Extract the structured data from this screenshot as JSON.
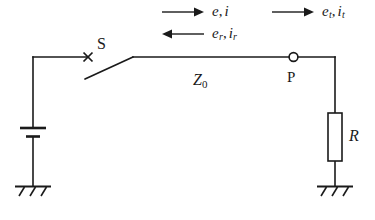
{
  "figure": {
    "name": "transmission-line-circuit",
    "background_color": "#ffffff",
    "line_color": "#1a1a1a"
  },
  "wave_annotations": [
    {
      "id": "incident",
      "arrow_direction": "right",
      "symbol_voltage": "e",
      "symbol_voltage_sub": "",
      "separator": ",",
      "symbol_current": "i",
      "symbol_current_sub": ""
    },
    {
      "id": "transmitted",
      "arrow_direction": "right",
      "symbol_voltage": "e",
      "symbol_voltage_sub": "t",
      "separator": ",",
      "symbol_current": "i",
      "symbol_current_sub": "t"
    },
    {
      "id": "reflected",
      "arrow_direction": "left",
      "symbol_voltage": "e",
      "symbol_voltage_sub": "r",
      "separator": ",",
      "symbol_current": "i",
      "symbol_current_sub": "r"
    }
  ],
  "components": {
    "switch": {
      "label": "S",
      "state": "open"
    },
    "node_p": {
      "label": "P"
    },
    "line_impedance": {
      "symbol": "Z",
      "subscript": "0"
    },
    "resistor": {
      "label": "R"
    },
    "source": {
      "type": "battery"
    },
    "grounds": [
      {
        "id": "ground-left"
      },
      {
        "id": "ground-right"
      }
    ]
  }
}
